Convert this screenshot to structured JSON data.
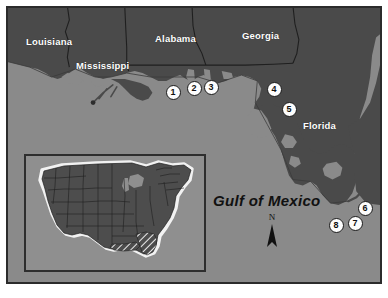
{
  "figure": {
    "name": "gulf-coast-study-area-map",
    "background_water_color": "#8a8a8a",
    "land_color": "#4a4a4a",
    "border_color": "#2b2b2b"
  },
  "labels": {
    "states": [
      {
        "name": "louisiana",
        "text": "Louisiana",
        "x": 18,
        "y": 28
      },
      {
        "name": "mississippi",
        "text": "Mississippi",
        "x": 68,
        "y": 52
      },
      {
        "name": "alabama",
        "text": "Alabama",
        "x": 147,
        "y": 25
      },
      {
        "name": "georgia",
        "text": "Georgia",
        "x": 234,
        "y": 22
      },
      {
        "name": "florida",
        "text": "Florida",
        "x": 295,
        "y": 112
      }
    ],
    "water_body": {
      "text": "Gulf of Mexico",
      "x": 205,
      "y": 184
    }
  },
  "north_arrow": {
    "letter": "N",
    "x": 256,
    "y": 206
  },
  "site_markers": [
    {
      "id": "1",
      "label": "1",
      "x": 165,
      "y": 84
    },
    {
      "id": "2",
      "label": "2",
      "x": 186,
      "y": 80
    },
    {
      "id": "3",
      "label": "3",
      "x": 203,
      "y": 79
    },
    {
      "id": "4",
      "label": "4",
      "x": 266,
      "y": 81
    },
    {
      "id": "5",
      "label": "5",
      "x": 281,
      "y": 101
    },
    {
      "id": "6",
      "label": "6",
      "x": 357,
      "y": 200
    },
    {
      "id": "7",
      "label": "7",
      "x": 347,
      "y": 215
    },
    {
      "id": "8",
      "label": "8",
      "x": 328,
      "y": 217
    }
  ],
  "inset": {
    "name": "united-states-locator-inset",
    "description": "Contiguous United States locator map with the Gulf Coast and Florida study region shown with diagonal hatching",
    "land_color": "#4d4d4d",
    "ocean_color": "#8f8f8f",
    "coast_highlight_color": "#f2f2f2",
    "hatch_color": "#ffffff"
  }
}
